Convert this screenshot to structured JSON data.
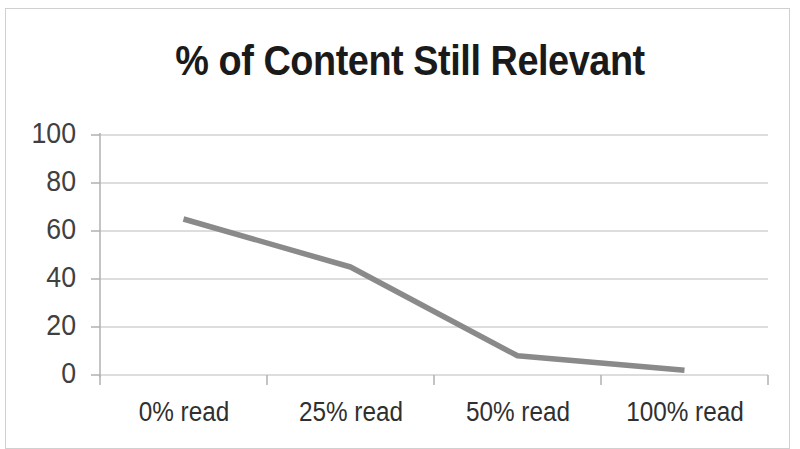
{
  "chart_data": {
    "type": "line",
    "title": "% of Content Still Relevant",
    "xlabel": "",
    "ylabel": "",
    "categories": [
      "0% read",
      "25% read",
      "50% read",
      "100% read"
    ],
    "values": [
      65,
      45,
      8,
      2
    ],
    "series": [
      {
        "name": "% of Content Still Relevant",
        "values": [
          65,
          45,
          8,
          2
        ]
      }
    ],
    "ylim": [
      0,
      100
    ],
    "y_ticks": [
      0,
      20,
      40,
      60,
      80,
      100
    ],
    "y_tick_labels": [
      "0",
      "20",
      "40",
      "60",
      "80",
      "100"
    ],
    "grid": true,
    "grid_axis": "y",
    "legend": false,
    "legend_position": "none",
    "line_color": "#8a8a8a",
    "grid_color": "#bcbcbc",
    "axis_color": "#b0b0b0",
    "title_color": "#1a1a1a",
    "background_color": "#ffffff",
    "markers": false
  }
}
